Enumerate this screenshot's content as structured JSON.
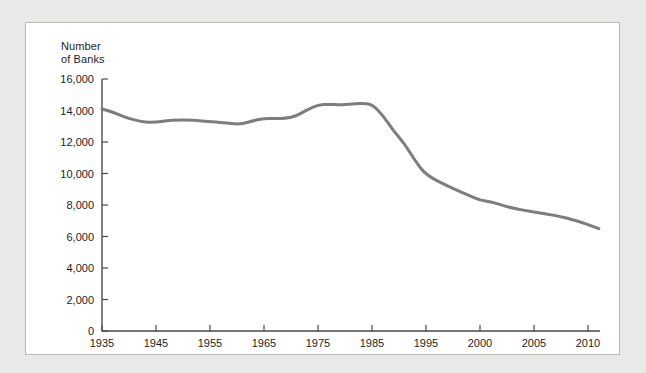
{
  "chart_data": {
    "type": "line",
    "title": "",
    "xlabel": "",
    "ylabel": "Number\nof Banks",
    "ylabel_line1": "Number",
    "ylabel_line2": "of Banks",
    "xlim": [
      1935,
      2011
    ],
    "ylim": [
      0,
      16000
    ],
    "grid": false,
    "legend": "none",
    "yticks": [
      0,
      2000,
      4000,
      6000,
      8000,
      10000,
      12000,
      14000,
      16000
    ],
    "ytick_labels": [
      "0",
      "2,000",
      "4,000",
      "6,000",
      "8,000",
      "10,000",
      "12,000",
      "14,000",
      "16,000"
    ],
    "xticks": [
      1935,
      1945,
      1955,
      1965,
      1975,
      1985,
      1995,
      2000,
      2005,
      2010
    ],
    "xtick_labels": [
      "1935",
      "1945",
      "1955",
      "1965",
      "1975",
      "1985",
      "1995",
      "2000",
      "2005",
      "2010"
    ],
    "x_axis_note": "Decade spacing 1935-1995, then 5-year spacing 1995-2010 at equal pixel intervals",
    "series": [
      {
        "name": "Number of Banks",
        "color": "#7d7d7d",
        "x": [
          1935,
          1937,
          1939,
          1941,
          1943,
          1945,
          1947,
          1949,
          1951,
          1953,
          1955,
          1957,
          1959,
          1961,
          1963,
          1965,
          1967,
          1969,
          1971,
          1973,
          1975,
          1977,
          1979,
          1981,
          1983,
          1985,
          1987,
          1989,
          1991,
          1993,
          1995,
          1997,
          1999,
          2000,
          2001,
          2002,
          2003,
          2005,
          2007,
          2009,
          2011
        ],
        "values": [
          14100,
          13900,
          13600,
          13400,
          13250,
          13250,
          13350,
          13400,
          13400,
          13350,
          13300,
          13250,
          13150,
          13150,
          13350,
          13500,
          13500,
          13500,
          13650,
          14050,
          14350,
          14400,
          14350,
          14400,
          14450,
          14400,
          13700,
          12700,
          11900,
          10800,
          9900,
          9200,
          8600,
          8300,
          8200,
          8000,
          7800,
          7550,
          7350,
          7000,
          6500
        ]
      }
    ]
  },
  "chart_colors": {
    "line": "#7d7d7d",
    "axis": "#4a4a4a",
    "panel_background": "#ffffff",
    "panel_border": "#b9b9b9",
    "page_background": "#e9e9e7",
    "text": "#1d1d1d"
  }
}
